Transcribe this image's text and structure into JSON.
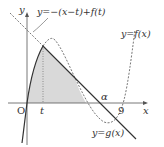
{
  "labels": {
    "y_axis": "y",
    "x_axis": "x",
    "origin": "O",
    "t": "t",
    "alpha": "α",
    "nine": "9",
    "tangent_line": "y=−(x−t)+f(t)",
    "f_curve": "y=f(x)",
    "g_curve": "y=g(x)"
  },
  "colors": {
    "curve": "#333333",
    "dashed": "#555555",
    "shade": "#d9d9d9",
    "axis": "#555555"
  }
}
